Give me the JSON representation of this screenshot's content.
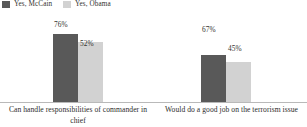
{
  "chart_data": {
    "type": "bar",
    "title": "",
    "subtitle": "",
    "xlabel": "",
    "ylabel": "",
    "ylim": [
      0,
      100
    ],
    "grid": false,
    "legend_position": "top-left",
    "value_suffix": "%",
    "categories": [
      "Can handle responsibilities of commander in chief",
      "Would do a good job on the terrorism issue"
    ],
    "series": [
      {
        "name": "Yes, McCain",
        "color": "#595959",
        "values": [
          76,
          52
        ]
      },
      {
        "name": "Yes, Obama",
        "color": "#d2d2d2",
        "values": [
          67,
          45
        ]
      }
    ],
    "value_labels": {
      "g0s0": "76%",
      "g0s1": "52%",
      "g1s0": "67%",
      "g1s1": "45%"
    }
  },
  "legend": {
    "items": [
      {
        "label": "Yes, McCain",
        "color": "#595959"
      },
      {
        "label": "Yes, Obama",
        "color": "#d2d2d2"
      }
    ]
  },
  "axis": {
    "baseline_color": "#b9b9b9"
  }
}
